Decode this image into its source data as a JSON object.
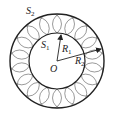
{
  "diagram": {
    "type": "concentric-circles-with-rolling-circles",
    "labels": {
      "outer_circle": {
        "main": "S",
        "sub": "2"
      },
      "inner_circle": {
        "main": "S",
        "sub": "1"
      },
      "center": {
        "main": "O"
      },
      "inner_radius": {
        "main": "R",
        "sub": "1"
      },
      "outer_radius": {
        "main": "R",
        "sub": "2"
      }
    },
    "geometry": {
      "center": [
        57,
        61
      ],
      "outer_radius": 47,
      "inner_radius": 28,
      "small_circle_count": 18
    },
    "colors": {
      "stroke": "#222222",
      "light_stroke": "#555555",
      "background": "#ffffff"
    }
  }
}
